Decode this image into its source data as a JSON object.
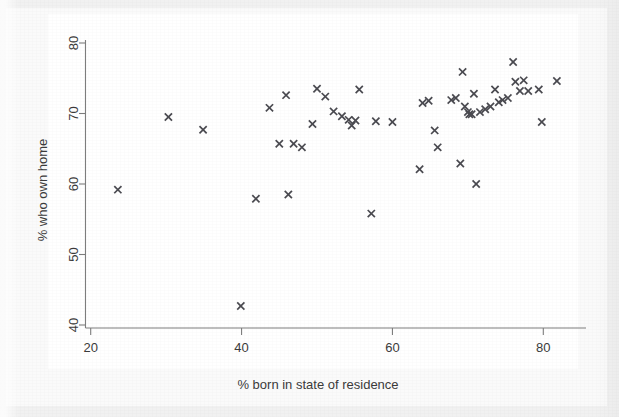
{
  "chart_data": {
    "type": "scatter",
    "title": "",
    "xlabel": "% born in state of residence",
    "ylabel": "% who own home",
    "xlim": [
      19,
      84
    ],
    "ylim": [
      39.5,
      81.5
    ],
    "xticks": [
      20,
      40,
      60,
      80
    ],
    "yticks": [
      40,
      50,
      60,
      70,
      80
    ],
    "grid": false,
    "legend": null,
    "marker": "x",
    "marker_color": "#4a4a50",
    "n_points": 50,
    "points": [
      [
        23.6,
        59.2
      ],
      [
        30.3,
        69.5
      ],
      [
        34.9,
        67.7
      ],
      [
        39.9,
        42.7
      ],
      [
        41.9,
        57.9
      ],
      [
        43.7,
        70.8
      ],
      [
        45.0,
        65.7
      ],
      [
        45.9,
        72.6
      ],
      [
        46.2,
        58.5
      ],
      [
        46.9,
        65.7
      ],
      [
        48.0,
        65.2
      ],
      [
        49.4,
        68.5
      ],
      [
        50.0,
        73.5
      ],
      [
        51.1,
        72.4
      ],
      [
        52.2,
        70.3
      ],
      [
        53.3,
        69.6
      ],
      [
        54.2,
        69.1
      ],
      [
        54.6,
        68.3
      ],
      [
        55.1,
        69.0
      ],
      [
        55.6,
        73.4
      ],
      [
        57.2,
        55.8
      ],
      [
        57.8,
        68.9
      ],
      [
        60.0,
        68.8
      ],
      [
        63.6,
        62.1
      ],
      [
        64.0,
        71.5
      ],
      [
        64.8,
        71.8
      ],
      [
        65.6,
        67.6
      ],
      [
        66.0,
        65.2
      ],
      [
        67.8,
        71.9
      ],
      [
        68.4,
        72.2
      ],
      [
        69.0,
        62.9
      ],
      [
        69.3,
        75.9
      ],
      [
        69.6,
        71.0
      ],
      [
        70.0,
        70.2
      ],
      [
        70.2,
        69.9
      ],
      [
        70.5,
        69.9
      ],
      [
        70.8,
        72.8
      ],
      [
        71.1,
        60.0
      ],
      [
        71.6,
        70.2
      ],
      [
        72.3,
        70.6
      ],
      [
        73.0,
        71.0
      ],
      [
        73.6,
        73.4
      ],
      [
        74.1,
        71.6
      ],
      [
        74.6,
        71.9
      ],
      [
        75.3,
        72.2
      ],
      [
        76.0,
        77.3
      ],
      [
        76.3,
        74.5
      ],
      [
        76.9,
        73.2
      ],
      [
        77.4,
        74.7
      ],
      [
        78.0,
        73.2
      ],
      [
        79.4,
        73.4
      ],
      [
        79.8,
        68.8
      ],
      [
        81.8,
        74.6
      ]
    ]
  },
  "axes": {
    "x_tick_labels": [
      "20",
      "40",
      "60",
      "80"
    ],
    "y_tick_labels": [
      "40",
      "50",
      "60",
      "70",
      "80"
    ]
  },
  "colors": {
    "marker": "#4a4a50",
    "axis": "#7d7d7d",
    "text": "#3b3b3b",
    "plot_background": "#ffffff",
    "page_background": "#f1f1f1"
  }
}
